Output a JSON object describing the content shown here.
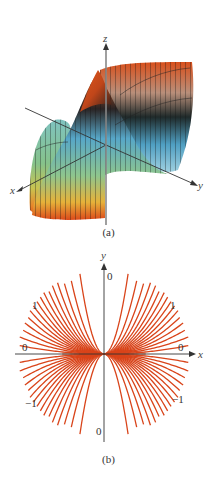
{
  "figure_a": {
    "caption": "(a)",
    "type": "3d-surface",
    "axes": {
      "x_label": "x",
      "y_label": "y",
      "z_label": "z"
    },
    "colormap": [
      "#d94a1a",
      "#e9782f",
      "#c8a98a",
      "#1e2b2a",
      "#5fa8c9",
      "#8fc9a0",
      "#e0c24a"
    ]
  },
  "figure_b": {
    "caption": "(b)",
    "type": "contour",
    "axes": {
      "x_label": "x",
      "y_label": "y"
    },
    "line_color": "#d9441a",
    "level_labels": {
      "top": "0",
      "bottom": "0",
      "left": "0",
      "right": "0",
      "upper_left": "1",
      "upper_right": "1",
      "lower_left": "−1",
      "lower_right": "−1"
    }
  },
  "chart_data": [
    {
      "type": "surface",
      "title": "(a)",
      "xlabel": "x",
      "ylabel": "y",
      "zlabel": "z",
      "function_hint": "z = 2x^2 y / (x^4 + y^2)"
    },
    {
      "type": "contour",
      "title": "(b)",
      "xlabel": "x",
      "ylabel": "y",
      "levels": [
        -1,
        0,
        1
      ],
      "level_curves": "y = k x^2 parabolas through origin",
      "labels": [
        {
          "text": "0",
          "position": "top of y-axis"
        },
        {
          "text": "0",
          "position": "bottom of y-axis"
        },
        {
          "text": "0",
          "position": "left end of x-axis"
        },
        {
          "text": "0",
          "position": "right end of x-axis"
        },
        {
          "text": "1",
          "position": "upper-left"
        },
        {
          "text": "1",
          "position": "upper-right"
        },
        {
          "text": "−1",
          "position": "lower-left"
        },
        {
          "text": "−1",
          "position": "lower-right"
        }
      ]
    }
  ]
}
